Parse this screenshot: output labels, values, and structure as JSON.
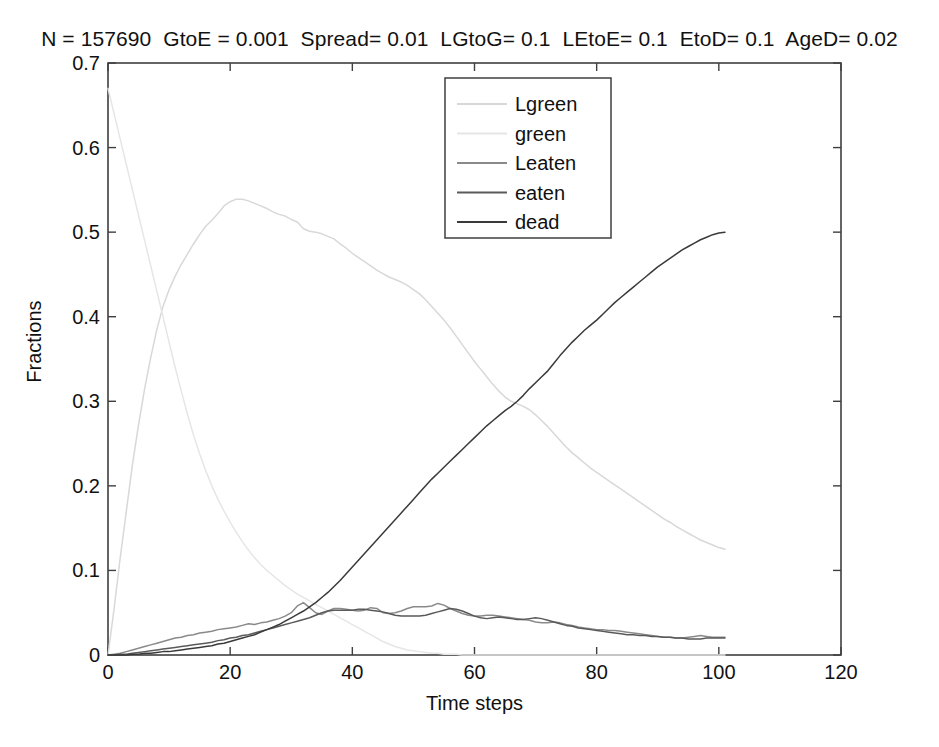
{
  "figure": {
    "title": "N = 157690  GtoE = 0.001  Spread= 0.01  LGtoG= 0.1  LEtoE= 0.1  EtoD= 0.1  AgeD= 0.02",
    "background": "#ffffff",
    "axis_color": "#3f3f3f"
  },
  "chart_data": {
    "type": "line",
    "title": "N = 157690  GtoE = 0.001  Spread= 0.01  LGtoG= 0.1  LEtoE= 0.1  EtoD= 0.1  AgeD= 0.02",
    "xlabel": "Time steps",
    "ylabel": "Fractions",
    "xlim": [
      0,
      120
    ],
    "ylim": [
      0,
      0.7
    ],
    "xticks": [
      0,
      20,
      40,
      60,
      80,
      100,
      120
    ],
    "yticks": [
      0,
      0.1,
      0.2,
      0.3,
      0.4,
      0.5,
      0.6,
      0.7
    ],
    "xtick_labels": [
      "0",
      "20",
      "40",
      "60",
      "80",
      "100",
      "120"
    ],
    "ytick_labels": [
      "0",
      "0.1",
      "0.2",
      "0.3",
      "0.4",
      "0.5",
      "0.6",
      "0.7"
    ],
    "grid": false,
    "legend_position": "upper center",
    "x": [
      0,
      1,
      2,
      3,
      4,
      5,
      6,
      7,
      8,
      9,
      10,
      11,
      12,
      13,
      14,
      15,
      16,
      17,
      18,
      19,
      20,
      21,
      22,
      23,
      24,
      25,
      26,
      27,
      28,
      29,
      30,
      31,
      32,
      33,
      34,
      35,
      36,
      37,
      38,
      39,
      40,
      41,
      42,
      43,
      44,
      45,
      46,
      47,
      48,
      49,
      50,
      51,
      52,
      53,
      54,
      55,
      56,
      57,
      58,
      59,
      60,
      61,
      62,
      63,
      64,
      65,
      66,
      67,
      68,
      69,
      70,
      71,
      72,
      73,
      74,
      75,
      76,
      77,
      78,
      79,
      80,
      81,
      82,
      83,
      84,
      85,
      86,
      87,
      88,
      89,
      90,
      91,
      92,
      93,
      94,
      95,
      96,
      97,
      98,
      99,
      100,
      101
    ],
    "series": [
      {
        "name": "Lgreen",
        "color": "#d8d8d8",
        "values": [
          0.0,
          0.055,
          0.115,
          0.17,
          0.225,
          0.272,
          0.315,
          0.352,
          0.385,
          0.412,
          0.432,
          0.448,
          0.462,
          0.474,
          0.486,
          0.497,
          0.507,
          0.514,
          0.522,
          0.531,
          0.536,
          0.539,
          0.539,
          0.537,
          0.534,
          0.531,
          0.528,
          0.524,
          0.521,
          0.519,
          0.515,
          0.512,
          0.504,
          0.501,
          0.5,
          0.498,
          0.495,
          0.492,
          0.486,
          0.481,
          0.475,
          0.47,
          0.465,
          0.46,
          0.455,
          0.451,
          0.447,
          0.444,
          0.441,
          0.437,
          0.432,
          0.427,
          0.42,
          0.412,
          0.404,
          0.396,
          0.387,
          0.377,
          0.367,
          0.357,
          0.347,
          0.338,
          0.329,
          0.32,
          0.312,
          0.305,
          0.3,
          0.297,
          0.294,
          0.29,
          0.284,
          0.277,
          0.27,
          0.262,
          0.254,
          0.246,
          0.239,
          0.233,
          0.227,
          0.221,
          0.216,
          0.211,
          0.206,
          0.201,
          0.196,
          0.191,
          0.186,
          0.181,
          0.176,
          0.171,
          0.166,
          0.161,
          0.157,
          0.152,
          0.148,
          0.144,
          0.14,
          0.136,
          0.133,
          0.13,
          0.127,
          0.125
        ]
      },
      {
        "name": "green",
        "color": "#e6e6e6",
        "values": [
          0.67,
          0.64,
          0.61,
          0.58,
          0.55,
          0.52,
          0.49,
          0.46,
          0.43,
          0.4,
          0.37,
          0.34,
          0.312,
          0.285,
          0.26,
          0.238,
          0.218,
          0.2,
          0.184,
          0.17,
          0.157,
          0.145,
          0.134,
          0.124,
          0.115,
          0.107,
          0.1,
          0.094,
          0.088,
          0.082,
          0.077,
          0.072,
          0.068,
          0.064,
          0.06,
          0.056,
          0.052,
          0.048,
          0.044,
          0.04,
          0.036,
          0.032,
          0.028,
          0.024,
          0.02,
          0.016,
          0.013,
          0.01,
          0.008,
          0.006,
          0.005,
          0.004,
          0.003,
          0.002,
          0.002,
          0.001,
          0.001,
          0.001,
          0.0,
          0.0,
          0.0,
          0.0,
          0.0,
          0.0,
          0.0,
          0.0,
          0.0,
          0.0,
          0.0,
          0.0,
          0.0,
          0.0,
          0.0,
          0.0,
          0.0,
          0.0,
          0.0,
          0.0,
          0.0,
          0.0,
          0.0,
          0.0,
          0.0,
          0.0,
          0.0,
          0.0,
          0.0,
          0.0,
          0.0,
          0.0,
          0.0,
          0.0,
          0.0,
          0.0,
          0.0,
          0.0,
          0.0,
          0.0,
          0.0,
          0.0,
          0.0,
          0.0
        ]
      },
      {
        "name": "Leaten",
        "color": "#8a8a8a",
        "values": [
          0.0,
          0.001,
          0.002,
          0.004,
          0.006,
          0.008,
          0.01,
          0.012,
          0.014,
          0.016,
          0.018,
          0.02,
          0.021,
          0.023,
          0.024,
          0.026,
          0.027,
          0.028,
          0.03,
          0.031,
          0.032,
          0.033,
          0.035,
          0.037,
          0.036,
          0.038,
          0.039,
          0.041,
          0.043,
          0.046,
          0.05,
          0.058,
          0.062,
          0.056,
          0.05,
          0.048,
          0.052,
          0.055,
          0.055,
          0.054,
          0.053,
          0.052,
          0.053,
          0.056,
          0.055,
          0.05,
          0.049,
          0.05,
          0.052,
          0.055,
          0.057,
          0.057,
          0.057,
          0.058,
          0.061,
          0.059,
          0.055,
          0.052,
          0.049,
          0.047,
          0.046,
          0.046,
          0.047,
          0.047,
          0.046,
          0.045,
          0.044,
          0.043,
          0.042,
          0.041,
          0.039,
          0.038,
          0.038,
          0.039,
          0.038,
          0.036,
          0.035,
          0.033,
          0.032,
          0.031,
          0.03,
          0.03,
          0.029,
          0.029,
          0.028,
          0.027,
          0.026,
          0.025,
          0.024,
          0.023,
          0.022,
          0.021,
          0.021,
          0.02,
          0.02,
          0.021,
          0.022,
          0.023,
          0.022,
          0.021,
          0.021,
          0.021
        ]
      },
      {
        "name": "eaten",
        "color": "#5a5a5a",
        "values": [
          0.0,
          0.0,
          0.001,
          0.001,
          0.002,
          0.003,
          0.004,
          0.005,
          0.006,
          0.007,
          0.008,
          0.009,
          0.01,
          0.011,
          0.012,
          0.013,
          0.014,
          0.015,
          0.017,
          0.018,
          0.02,
          0.021,
          0.023,
          0.024,
          0.026,
          0.028,
          0.03,
          0.032,
          0.034,
          0.036,
          0.038,
          0.04,
          0.042,
          0.044,
          0.047,
          0.05,
          0.052,
          0.053,
          0.053,
          0.053,
          0.053,
          0.054,
          0.054,
          0.053,
          0.052,
          0.051,
          0.049,
          0.047,
          0.046,
          0.046,
          0.046,
          0.046,
          0.047,
          0.049,
          0.051,
          0.053,
          0.055,
          0.054,
          0.052,
          0.049,
          0.046,
          0.044,
          0.043,
          0.044,
          0.045,
          0.044,
          0.043,
          0.042,
          0.042,
          0.043,
          0.044,
          0.043,
          0.041,
          0.039,
          0.037,
          0.035,
          0.034,
          0.032,
          0.031,
          0.03,
          0.029,
          0.028,
          0.027,
          0.026,
          0.025,
          0.024,
          0.024,
          0.023,
          0.023,
          0.022,
          0.022,
          0.021,
          0.021,
          0.02,
          0.02,
          0.019,
          0.019,
          0.019,
          0.02,
          0.02,
          0.02,
          0.02
        ]
      },
      {
        "name": "dead",
        "color": "#3a3a3a",
        "values": [
          0.0,
          0.0,
          0.0,
          0.0,
          0.001,
          0.001,
          0.002,
          0.002,
          0.003,
          0.004,
          0.004,
          0.005,
          0.006,
          0.007,
          0.008,
          0.009,
          0.01,
          0.011,
          0.013,
          0.014,
          0.016,
          0.018,
          0.02,
          0.022,
          0.024,
          0.027,
          0.03,
          0.033,
          0.036,
          0.04,
          0.044,
          0.048,
          0.052,
          0.057,
          0.062,
          0.068,
          0.074,
          0.081,
          0.088,
          0.096,
          0.104,
          0.112,
          0.12,
          0.128,
          0.136,
          0.144,
          0.152,
          0.16,
          0.168,
          0.176,
          0.184,
          0.192,
          0.2,
          0.208,
          0.215,
          0.222,
          0.229,
          0.236,
          0.243,
          0.25,
          0.257,
          0.264,
          0.271,
          0.277,
          0.283,
          0.289,
          0.294,
          0.3,
          0.307,
          0.315,
          0.322,
          0.329,
          0.336,
          0.345,
          0.354,
          0.362,
          0.37,
          0.377,
          0.384,
          0.39,
          0.396,
          0.403,
          0.41,
          0.417,
          0.423,
          0.429,
          0.435,
          0.441,
          0.447,
          0.453,
          0.459,
          0.464,
          0.469,
          0.474,
          0.479,
          0.483,
          0.487,
          0.491,
          0.494,
          0.497,
          0.499,
          0.5
        ]
      }
    ]
  },
  "legend": {
    "entries": [
      {
        "label": "Lgreen",
        "color": "#d8d8d8"
      },
      {
        "label": "green",
        "color": "#e6e6e6"
      },
      {
        "label": "Leaten",
        "color": "#8a8a8a"
      },
      {
        "label": "eaten",
        "color": "#5a5a5a"
      },
      {
        "label": "dead",
        "color": "#3a3a3a"
      }
    ]
  }
}
